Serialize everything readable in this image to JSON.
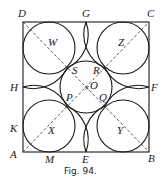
{
  "figure": {
    "caption": "Fig. 94.",
    "square": {
      "x": 23,
      "y": 22,
      "w": 126,
      "h": 130
    },
    "center": {
      "label": "O",
      "x": 86,
      "y": 87
    },
    "central_circle_r": 26,
    "corner_circle_r": 25,
    "corner_labels": {
      "A": "A",
      "B": "B",
      "C": "C",
      "D": "D"
    },
    "mid_labels": {
      "E": "E",
      "F": "F",
      "G": "G",
      "H": "H"
    },
    "other_labels": {
      "K": "K",
      "M": "M"
    },
    "circle_labels": {
      "W": "W",
      "X": "X",
      "Y": "Y",
      "Z": "Z"
    },
    "tangent_labels": {
      "P": "P",
      "Q": "Q",
      "R": "R",
      "S": "S"
    }
  }
}
